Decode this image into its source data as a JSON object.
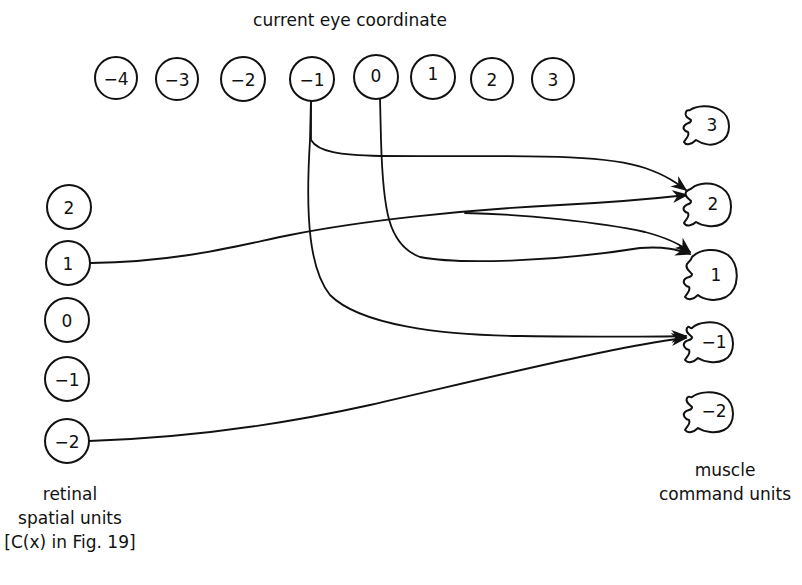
{
  "title": "current eye coordinate",
  "eye_units": [
    "−4",
    "−3",
    "−2",
    "−1",
    "0",
    "1",
    "2",
    "3"
  ],
  "retinal_units": [
    "2",
    "1",
    "0",
    "−1",
    "−2"
  ],
  "muscle_units": [
    "3",
    "2",
    "1",
    "−1",
    "−2"
  ],
  "labels": {
    "retinal": [
      "retinal",
      "spatial units",
      "[C(x) in Fig. 19]"
    ],
    "muscle": [
      "muscle",
      "command units"
    ]
  },
  "connections": [
    {
      "from": "eye −1",
      "to": "muscle 2"
    },
    {
      "from": "eye −1",
      "to": "muscle −1"
    },
    {
      "from": "eye 0",
      "to": "muscle 1"
    },
    {
      "from": "retinal 1",
      "to": "muscle 2"
    },
    {
      "from": "retinal 1",
      "to": "muscle 1"
    },
    {
      "from": "retinal −2",
      "to": "muscle −1"
    }
  ]
}
